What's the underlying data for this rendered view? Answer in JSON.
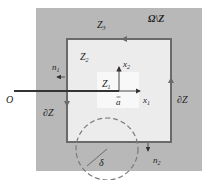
{
  "labels": {
    "outer_region": "Ω\\Z",
    "z3": "Z",
    "z3_sub": "3",
    "z2": "Z",
    "z2_sub": "2",
    "z1": "Z",
    "z1_sub": "1",
    "x2": "x",
    "x2_sub": "2",
    "x1": "x",
    "x1_sub": "1",
    "a": "a",
    "origin": "O",
    "n1": "n",
    "n1_sub": "1",
    "n2": "n",
    "n2_sub": "2",
    "boundary_left": "∂Z",
    "boundary_right": "∂Z",
    "delta": "δ"
  },
  "colors": {
    "outer_fill": "#b8b8b8",
    "inner_fill": "#ececec",
    "z1_fill": "#f8f8f8",
    "boundary": "#6a6a6a",
    "line": "#333333",
    "dashed": "#7a7a7a"
  }
}
